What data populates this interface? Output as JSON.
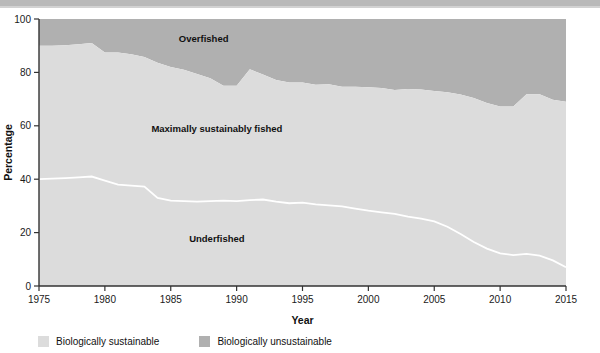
{
  "chart_data": {
    "type": "area",
    "title": "",
    "subtitle": "",
    "xlabel": "Year",
    "ylabel": "Percentage",
    "xlim": [
      1975,
      2015
    ],
    "ylim": [
      0,
      100
    ],
    "xticks": [
      1975,
      1980,
      1985,
      1990,
      1995,
      2000,
      2005,
      2010,
      2015
    ],
    "yticks": [
      0,
      20,
      40,
      60,
      80,
      100
    ],
    "grid": false,
    "stacked": true,
    "legend_position": "bottom-left",
    "colors": {
      "biologically_sustainable": "#dcdcdc",
      "biologically_unsustainable": "#b0b0b0",
      "divider_line": "#ffffff",
      "axis": "#333333",
      "text": "#111111"
    },
    "x": [
      1975,
      1976,
      1977,
      1978,
      1979,
      1980,
      1981,
      1982,
      1983,
      1984,
      1985,
      1986,
      1987,
      1988,
      1989,
      1990,
      1991,
      1992,
      1993,
      1994,
      1995,
      1996,
      1997,
      1998,
      1999,
      2000,
      2001,
      2002,
      2003,
      2004,
      2005,
      2006,
      2007,
      2008,
      2009,
      2010,
      2011,
      2012,
      2013,
      2014,
      2015
    ],
    "series": [
      {
        "name": "Underfished",
        "label": "Underfished",
        "stack_order": 1,
        "color": "#dcdcdc",
        "values": [
          40.0,
          40.2,
          40.4,
          40.7,
          41.0,
          39.5,
          38.0,
          37.6,
          37.2,
          33.0,
          32.0,
          31.8,
          31.6,
          31.8,
          32.0,
          31.8,
          32.2,
          32.4,
          31.6,
          31.0,
          31.2,
          30.6,
          30.2,
          29.8,
          29.0,
          28.2,
          27.6,
          27.0,
          26.0,
          25.2,
          24.2,
          22.2,
          19.5,
          16.5,
          14.0,
          12.2,
          11.6,
          12.0,
          11.4,
          9.6,
          7.0
        ]
      },
      {
        "name": "Maximally sustainably fished",
        "label": "Maximally sustainably fished",
        "stack_order": 2,
        "color": "#dcdcdc",
        "values": [
          50.0,
          49.8,
          49.8,
          49.8,
          50.0,
          48.0,
          49.5,
          49.2,
          48.6,
          50.6,
          50.0,
          49.2,
          47.8,
          46.0,
          43.0,
          43.2,
          49.0,
          46.8,
          45.6,
          45.2,
          45.0,
          44.8,
          45.4,
          44.8,
          45.6,
          46.2,
          46.6,
          46.4,
          47.8,
          48.4,
          48.8,
          50.4,
          52.2,
          53.9,
          54.5,
          55.0,
          55.6,
          59.8,
          60.4,
          60.2,
          62.0
        ]
      },
      {
        "name": "Overfished",
        "label": "Overfished",
        "stack_order": 3,
        "color": "#b0b0b0",
        "values": [
          10.0,
          10.0,
          9.8,
          9.5,
          9.0,
          12.5,
          12.5,
          13.2,
          14.2,
          16.4,
          18.0,
          19.0,
          20.6,
          22.2,
          25.0,
          25.0,
          18.8,
          20.8,
          22.8,
          23.8,
          23.8,
          24.6,
          24.4,
          25.4,
          25.4,
          25.6,
          25.8,
          26.6,
          26.2,
          26.4,
          27.0,
          27.4,
          28.3,
          29.6,
          31.5,
          32.8,
          32.8,
          28.2,
          28.2,
          30.2,
          31.0
        ]
      }
    ],
    "boundaries": {
      "underfished_top": [
        40.0,
        40.2,
        40.4,
        40.7,
        41.0,
        39.5,
        38.0,
        37.6,
        37.2,
        33.0,
        32.0,
        31.8,
        31.6,
        31.8,
        32.0,
        31.8,
        32.2,
        32.4,
        31.6,
        31.0,
        31.2,
        30.6,
        30.2,
        29.8,
        29.0,
        28.2,
        27.6,
        27.0,
        26.0,
        25.2,
        24.2,
        22.2,
        19.5,
        16.5,
        14.0,
        12.2,
        11.6,
        12.0,
        11.4,
        9.6,
        7.0
      ],
      "sustainable_top": [
        90.0,
        90.0,
        90.2,
        90.5,
        91.0,
        87.5,
        87.5,
        86.8,
        85.8,
        83.6,
        82.0,
        81.0,
        79.4,
        77.8,
        75.0,
        75.0,
        81.2,
        79.2,
        77.2,
        76.2,
        76.2,
        75.4,
        75.6,
        74.6,
        74.6,
        74.4,
        74.2,
        73.4,
        73.8,
        73.6,
        73.0,
        72.6,
        71.7,
        70.4,
        68.5,
        67.2,
        67.2,
        71.8,
        71.8,
        69.8,
        69.0
      ]
    },
    "annotations": [
      {
        "name": "overfished-label",
        "text": "Overfished",
        "x_year": 1987.5,
        "y_pct": 91.5
      },
      {
        "name": "maximally-label",
        "text": "Maximally sustainably fished",
        "x_year": 1988.5,
        "y_pct": 57.5
      },
      {
        "name": "underfished-label",
        "text": "Underfished",
        "x_year": 1988.5,
        "y_pct": 16.5
      }
    ],
    "legend": [
      {
        "label": "Biologically sustainable",
        "color": "#dcdcdc",
        "swatch": "legend-swatch-sustainable"
      },
      {
        "label": "Biologically unsustainable",
        "color": "#b0b0b0",
        "swatch": "legend-swatch-unsustainable"
      }
    ]
  }
}
